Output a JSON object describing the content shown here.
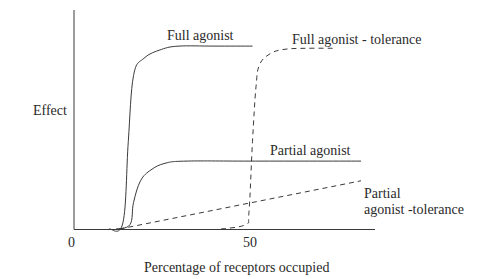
{
  "chart_data": {
    "type": "line",
    "title": "",
    "xlabel": "Percentage of receptors occupied",
    "ylabel": "Effect",
    "x_ticks": [
      "0",
      "50"
    ],
    "xlim": [
      0,
      86
    ],
    "ylim": [
      0,
      100
    ],
    "grid": false,
    "legend": "inline labels",
    "series": [
      {
        "name": "Full agonist",
        "style": "solid",
        "x": [
          10,
          14,
          15.5,
          17,
          20,
          25,
          30,
          40,
          51
        ],
        "y": [
          0,
          3,
          40,
          70,
          78,
          82,
          83.5,
          83.5,
          83.5
        ]
      },
      {
        "name": "Full agonist - tolerance",
        "style": "dashed",
        "x": [
          42,
          49,
          50,
          51,
          52,
          53,
          56,
          60,
          66,
          75
        ],
        "y": [
          0,
          2,
          8,
          40,
          65,
          75,
          80,
          82,
          82.5,
          82.5
        ]
      },
      {
        "name": "Partial agonist",
        "style": "solid",
        "x": [
          12,
          16,
          17,
          19,
          22,
          26,
          32,
          50,
          82
        ],
        "y": [
          0,
          2,
          12,
          22,
          27,
          30,
          31,
          31,
          31
        ]
      },
      {
        "name": "Partial agonist -tolerance",
        "style": "dashed",
        "x": [
          13,
          82
        ],
        "y": [
          0,
          22
        ]
      }
    ]
  },
  "labels": {
    "y_axis": "Effect",
    "x_axis": "Percentage of receptors occupied",
    "tick_0": "0",
    "tick_50": "50",
    "full_agonist": "Full agonist",
    "full_agonist_tolerance": "Full agonist - tolerance",
    "partial_agonist": "Partial agonist",
    "partial_agonist_tolerance_line1": "Partial",
    "partial_agonist_tolerance_line2": "agonist -tolerance"
  }
}
